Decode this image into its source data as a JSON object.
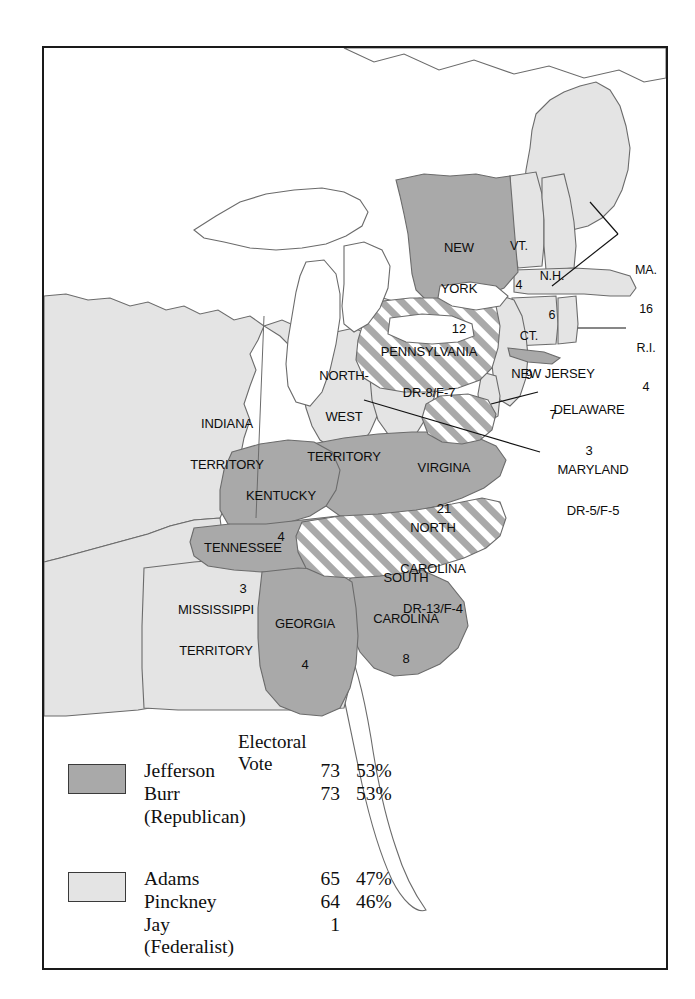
{
  "map": {
    "title": "United States Presidential Election of 1800 — Electoral Map",
    "colors": {
      "republican_fill": "#a9a9a9",
      "federalist_fill": "#e4e4e4",
      "split_hatch_dark": "#a9a9a9",
      "split_hatch_light": "#ffffff",
      "unorganized_fill": "#ffffff",
      "outline": "#555555",
      "frame": "#1a1a1a",
      "text": "#0d0d0d"
    },
    "states": [
      {
        "id": "vermont",
        "name": "VT.",
        "votes": "4",
        "party": "federalist",
        "label_lines": [
          "VT.",
          "4"
        ]
      },
      {
        "id": "new-hampshire",
        "name": "N.H.",
        "votes": "6",
        "party": "federalist",
        "label_lines": [
          "N.H.",
          "6"
        ]
      },
      {
        "id": "massachusetts",
        "name": "MA.",
        "votes": "16",
        "party": "federalist",
        "label_lines": [
          "MA.",
          "16"
        ]
      },
      {
        "id": "rhode-island",
        "name": "R.I.",
        "votes": "4",
        "party": "federalist",
        "label_lines": [
          "R.I.",
          "4"
        ]
      },
      {
        "id": "connecticut",
        "name": "CT.",
        "votes": "9",
        "party": "federalist",
        "label_lines": [
          "CT.",
          "9"
        ]
      },
      {
        "id": "new-york",
        "name": "NEW YORK",
        "votes": "12",
        "party": "republican",
        "label_lines": [
          "NEW",
          "YORK",
          "12"
        ]
      },
      {
        "id": "new-jersey",
        "name": "NEW JERSEY",
        "votes": "7",
        "party": "federalist",
        "label_lines": [
          "NEW JERSEY",
          "7"
        ]
      },
      {
        "id": "pennsylvania",
        "name": "PENNSYLVANIA",
        "votes": "DR-8/F-7",
        "party": "split",
        "label_lines": [
          "PENNSYLVANIA",
          "DR-8/F-7"
        ]
      },
      {
        "id": "delaware",
        "name": "DELAWARE",
        "votes": "3",
        "party": "federalist",
        "label_lines": [
          "DELAWARE",
          "3"
        ]
      },
      {
        "id": "maryland",
        "name": "MARYLAND",
        "votes": "DR-5/F-5",
        "party": "split",
        "label_lines": [
          "MARYLAND",
          "DR-5/F-5"
        ]
      },
      {
        "id": "virginia",
        "name": "VIRGINA",
        "votes": "21",
        "party": "republican",
        "label_lines": [
          "VIRGINA",
          "21"
        ]
      },
      {
        "id": "north-carolina",
        "name": "NORTH CAROLINA",
        "votes": "DR-13/F-4",
        "party": "split",
        "label_lines": [
          "NORTH",
          "CAROLINA",
          "DR-13/F-4"
        ]
      },
      {
        "id": "south-carolina",
        "name": "SOUTH CAROLINA",
        "votes": "8",
        "party": "republican",
        "label_lines": [
          "SOUTH",
          "CAROLINA",
          "8"
        ]
      },
      {
        "id": "georgia",
        "name": "GEORGIA",
        "votes": "4",
        "party": "republican",
        "label_lines": [
          "GEORGIA",
          "4"
        ]
      },
      {
        "id": "kentucky",
        "name": "KENTUCKY",
        "votes": "4",
        "party": "republican",
        "label_lines": [
          "KENTUCKY",
          "4"
        ]
      },
      {
        "id": "tennessee",
        "name": "TENNESSEE",
        "votes": "3",
        "party": "republican",
        "label_lines": [
          "TENNESSEE",
          "3"
        ]
      }
    ],
    "territories": [
      {
        "id": "indiana-territory",
        "label_lines": [
          "INDIANA",
          "TERRITORY"
        ]
      },
      {
        "id": "northwest-territory",
        "label_lines": [
          "NORTH-",
          "WEST",
          "TERRITORY"
        ]
      },
      {
        "id": "mississippi-territory",
        "label_lines": [
          "MISSISSIPPI",
          "TERRITORY"
        ]
      }
    ],
    "labels": {
      "vt": "VT.",
      "vt_votes": "4",
      "nh": "N.H.",
      "nh_votes": "6",
      "ma": "MA.",
      "ma_votes": "16",
      "ri": "R.I.",
      "ri_votes": "4",
      "ct": "CT.",
      "ct_votes": "9",
      "ny_1": "NEW",
      "ny_2": "YORK",
      "ny_votes": "12",
      "nj": "NEW JERSEY",
      "nj_votes": "7",
      "pa": "PENNSYLVANIA",
      "pa_votes": "DR-8/F-7",
      "de": "DELAWARE",
      "de_votes": "3",
      "md": "MARYLAND",
      "md_votes": "DR-5/F-5",
      "va": "VIRGINA",
      "va_votes": "21",
      "nc_1": "NORTH",
      "nc_2": "CAROLINA",
      "nc_votes": "DR-13/F-4",
      "sc_1": "SOUTH",
      "sc_2": "CAROLINA",
      "sc_votes": "8",
      "ga": "GEORGIA",
      "ga_votes": "4",
      "ky": "KENTUCKY",
      "ky_votes": "4",
      "tn": "TENNESSEE",
      "tn_votes": "3",
      "indiana_1": "INDIANA",
      "indiana_2": "TERRITORY",
      "nw_1": "NORTH-",
      "nw_2": "WEST",
      "nw_3": "TERRITORY",
      "miss_1": "MISSISSIPPI",
      "miss_2": "TERRITORY"
    }
  },
  "legend": {
    "heading": "Electoral Vote",
    "groups": [
      {
        "id": "republican",
        "swatch_color": "#a9a9a9",
        "party_line": "(Republican)",
        "rows": [
          {
            "name": "Jefferson",
            "votes": "73",
            "pct": "53%"
          },
          {
            "name": "Burr",
            "votes": "73",
            "pct": "53%"
          }
        ]
      },
      {
        "id": "federalist",
        "swatch_color": "#e4e4e4",
        "party_line": "(Federalist)",
        "rows": [
          {
            "name": "Adams",
            "votes": "65",
            "pct": "47%"
          },
          {
            "name": "Pinckney",
            "votes": "64",
            "pct": "46%"
          },
          {
            "name": "Jay",
            "votes": "1",
            "pct": ""
          }
        ]
      }
    ],
    "republican": {
      "names_block": "Jefferson\nBurr\n(Republican)",
      "votes_block": "73\n73",
      "pcts_block": "53%\n53%"
    },
    "federalist": {
      "names_block": "Adams\nPinckney\nJay\n(Federalist)",
      "votes_block": "65\n64\n1",
      "pcts_block": "47%\n46%"
    }
  }
}
